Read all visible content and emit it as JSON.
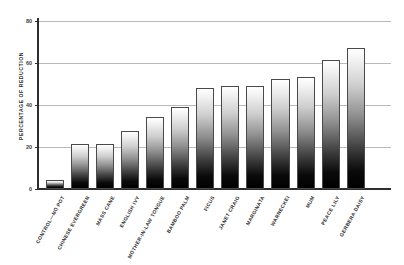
{
  "chart_data": {
    "type": "bar",
    "title": "",
    "xlabel": "",
    "ylabel": "PERCENTAGE OF REDUCTION",
    "ylim": [
      0,
      80
    ],
    "yticks": [
      0,
      20,
      40,
      60,
      80
    ],
    "grid": true,
    "legend": "none",
    "categories": [
      "CONTROL—NO POT",
      "CHINESE EVERGREEN",
      "MASS CANE",
      "ENGLISH IVY",
      "MOTHER-IN-LAW TONGUE",
      "BAMBOO PALM",
      "FICUS",
      "JANET CRAIG",
      "MARGINATA",
      "WARNECKEI",
      "MUM",
      "PEACE LILY",
      "GERBERA DAISY"
    ],
    "values": [
      4,
      21,
      21,
      27.5,
      34,
      39,
      48,
      49,
      49,
      52,
      53,
      61,
      67
    ]
  },
  "axis": {
    "y_title": "PERCENTAGE OF REDUCTION",
    "y_tick_labels": [
      "0",
      "20",
      "40",
      "60",
      "80"
    ]
  }
}
